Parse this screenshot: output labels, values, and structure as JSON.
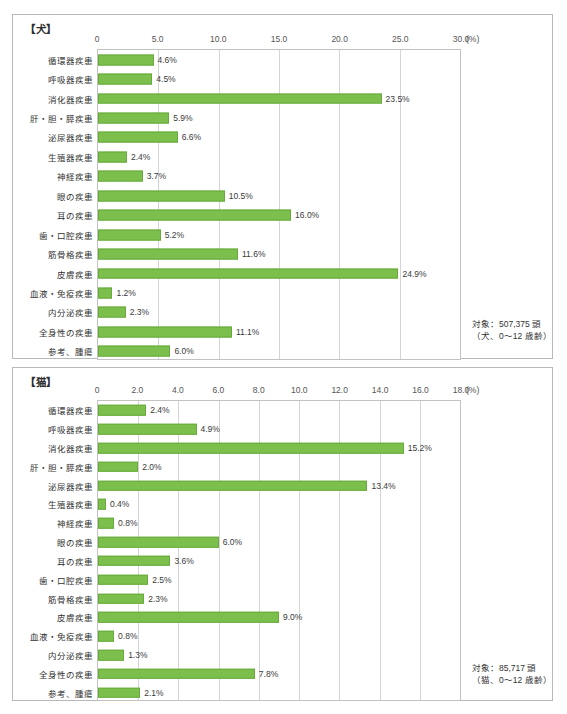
{
  "chart_data": [
    {
      "type": "bar",
      "orientation": "horizontal",
      "title": "【犬】",
      "xlabel": "(%)",
      "ylabel": "",
      "xlim": [
        0,
        30
      ],
      "xticks": [
        "0",
        "5.0",
        "10.0",
        "15.0",
        "20.0",
        "25.0",
        "30.0"
      ],
      "xtick_values": [
        0,
        5,
        10,
        15,
        20,
        25,
        30
      ],
      "unit_label": "(%)",
      "grid": true,
      "legend": "none",
      "bar_color": "#7cbf4d",
      "categories": [
        "循環器疾患",
        "呼吸器疾患",
        "消化器疾患",
        "肝・胆・膵疾患",
        "泌尿器疾患",
        "生殖器疾患",
        "神経疾患",
        "眼の疾患",
        "耳の疾患",
        "歯・口腔疾患",
        "筋骨格疾患",
        "皮膚疾患",
        "血液・免疫疾患",
        "内分泌疾患",
        "全身性の疾患",
        "参考、腫瘍"
      ],
      "values": [
        4.6,
        4.5,
        23.5,
        5.9,
        6.6,
        2.4,
        3.7,
        10.5,
        16.0,
        5.2,
        11.6,
        24.9,
        1.2,
        2.3,
        11.1,
        6.0
      ],
      "value_labels": [
        "4.6%",
        "4.5%",
        "23.5%",
        "5.9%",
        "6.6%",
        "2.4%",
        "3.7%",
        "10.5%",
        "16.0%",
        "5.2%",
        "11.6%",
        "24.9%",
        "1.2%",
        "2.3%",
        "11.1%",
        "6.0%"
      ],
      "annotation": "対象：507,375 頭\n（犬、0～12 歳齢）"
    },
    {
      "type": "bar",
      "orientation": "horizontal",
      "title": "【猫】",
      "xlabel": "(%)",
      "ylabel": "",
      "xlim": [
        0,
        18
      ],
      "xticks": [
        "0",
        "2.0",
        "4.0",
        "6.0",
        "8.0",
        "10.0",
        "12.0",
        "14.0",
        "16.0",
        "18.0"
      ],
      "xtick_values": [
        0,
        2,
        4,
        6,
        8,
        10,
        12,
        14,
        16,
        18
      ],
      "unit_label": "(%)",
      "grid": true,
      "legend": "none",
      "bar_color": "#7cbf4d",
      "categories": [
        "循環器疾患",
        "呼吸器疾患",
        "消化器疾患",
        "肝・胆・膵疾患",
        "泌尿器疾患",
        "生殖器疾患",
        "神経疾患",
        "眼の疾患",
        "耳の疾患",
        "歯・口腔疾患",
        "筋骨格疾患",
        "皮膚疾患",
        "血液・免疫疾患",
        "内分泌疾患",
        "全身性の疾患",
        "参考、腫瘍"
      ],
      "values": [
        2.4,
        4.9,
        15.2,
        2.0,
        13.4,
        0.4,
        0.8,
        6.0,
        3.6,
        2.5,
        2.3,
        9.0,
        0.8,
        1.3,
        7.8,
        2.1
      ],
      "value_labels": [
        "2.4%",
        "4.9%",
        "15.2%",
        "2.0%",
        "13.4%",
        "0.4%",
        "0.8%",
        "6.0%",
        "3.6%",
        "2.5%",
        "2.3%",
        "9.0%",
        "0.8%",
        "1.3%",
        "7.8%",
        "2.1%"
      ],
      "annotation": "対象：85,717 頭\n（猫、0～12 歳齢）"
    }
  ]
}
